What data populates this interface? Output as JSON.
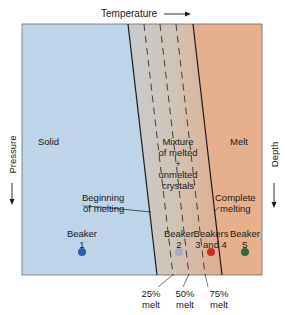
{
  "axes": {
    "top_label": "Temperature",
    "left_label": "Pressure",
    "right_label": "Depth"
  },
  "regions": {
    "solid": "Solid",
    "mixture": [
      "Mixture",
      "of melted",
      "+",
      "unmelted",
      "crystals"
    ],
    "melt": "Melt"
  },
  "boundaries": {
    "beginning": [
      "Beginning",
      "of melting"
    ],
    "complete": [
      "Complete",
      "melting"
    ]
  },
  "beakers": [
    {
      "label": [
        "Beaker",
        "1"
      ],
      "color": "#2b5fa8"
    },
    {
      "label": [
        "Beaker",
        "2"
      ],
      "color": "#a9a6c9"
    },
    {
      "label": [
        "Beakers",
        "3 and 4"
      ],
      "color": "#cc2a1e"
    },
    {
      "label": [
        "Beaker",
        "5"
      ],
      "color": "#2f6b3a"
    }
  ],
  "melt_levels": [
    {
      "pct": "25%",
      "word": "melt"
    },
    {
      "pct": "50%",
      "word": "melt"
    },
    {
      "pct": "75%",
      "word": "melt"
    }
  ],
  "colors": {
    "solid_region": "#bcd3e8",
    "melt_region": "#e8b08c",
    "mixture_start": "#c9cbcf",
    "mixture_end": "#dcae8c"
  }
}
